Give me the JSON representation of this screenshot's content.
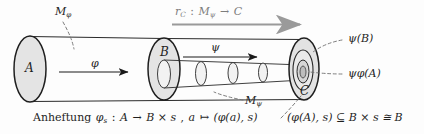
{
  "figure": {
    "kind": "mathematical-diagram",
    "language": "German",
    "background_color": "#fdfdfd",
    "ink_color": "#1a1a1a",
    "fill_color": "#e2e2e2",
    "gray_arrow_color": "#9a9a9a"
  },
  "labels": {
    "m_phi": {
      "base": "M",
      "sub": "φ"
    },
    "m_psi": {
      "base": "M",
      "sub": "ψ"
    },
    "top_arrow": {
      "r": "r",
      "r_sub": "C",
      "colon": " : ",
      "m": "M",
      "m_sub": "ψ",
      "to": " → ",
      "target": "C"
    },
    "disc_a": "A",
    "disc_b": "B",
    "disc_c": "C",
    "phi_arrow": "φ",
    "psi_arrow": "ψ",
    "psi_b": "ψ(B)",
    "psi_phi_a": "ψφ(A)"
  },
  "caption": {
    "word": "Anheftung",
    "map_name": "φ",
    "map_sub": "s",
    "colon": " : ",
    "source": "A",
    "arrow": " → ",
    "target": "B × s",
    "comma": " , ",
    "element": "a",
    "mapsto": " ↦ ",
    "image": "(φ(a), s)"
  },
  "formula": {
    "text": "(φ(A), s) ⊆ B × s ≅ B"
  }
}
